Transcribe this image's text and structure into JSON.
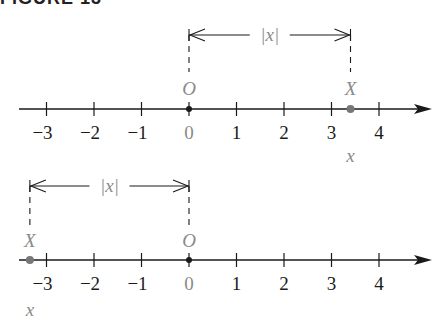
{
  "title": "FIGURE 13",
  "colors": {
    "axis": "#1a1a1a",
    "label_gray": "#8a8a8a",
    "dot": "#777777"
  },
  "diagrams": [
    {
      "name": "positive-case",
      "origin_label": "O",
      "point_label": "X",
      "distance_label": "|x|",
      "coord_label": "x",
      "point_value": 3.4,
      "ticks": [
        "−3",
        "−2",
        "−1",
        "0",
        "1",
        "2",
        "3",
        "4"
      ]
    },
    {
      "name": "negative-case",
      "origin_label": "O",
      "point_label": "X",
      "distance_label": "|x|",
      "coord_label": "x",
      "point_value": -3.35,
      "ticks": [
        "−3",
        "−2",
        "−1",
        "0",
        "1",
        "2",
        "3",
        "4"
      ]
    }
  ]
}
